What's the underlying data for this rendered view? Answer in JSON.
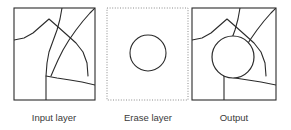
{
  "diagram": {
    "type": "erase-operation-illustration",
    "background_color": "#ffffff",
    "stroke_color": "#2b2b2b",
    "label_color": "#3a3a3a",
    "panels": [
      {
        "id": "input-layer",
        "label": "Input layer",
        "border_style": "solid",
        "label_x": 54,
        "label_y": 121,
        "frame": {
          "x": 14,
          "y": 8,
          "width": 81,
          "height": 92
        },
        "content": "polygon boundaries",
        "paths": [
          "M14,40 L24,38 L33,33 L41,26 L49,19 L57,26 L66,34 L76,43 L83,52 L87,63 L88,76",
          "M62,8 L60,19 L57,30 L53,41 L49,52 L47,63 L46,76 L46,88 L46,100",
          "M95,8 L90,13 L83,21 L76,30 L69,40 L63,50 L58,60 L54,69 L51,76",
          "M46,76 L57,78 L70,80 L82,82 L95,85"
        ]
      },
      {
        "id": "erase-layer",
        "label": "Erase layer",
        "border_style": "dotted",
        "label_x": 148,
        "label_y": 121,
        "frame": {
          "x": 107,
          "y": 8,
          "width": 81,
          "height": 92
        },
        "content": "circle",
        "circle": {
          "cx": 148,
          "cy": 53,
          "r": 18
        }
      },
      {
        "id": "output",
        "label": "Output",
        "border_style": "solid",
        "label_x": 234,
        "label_y": 121,
        "frame": {
          "x": 192,
          "y": 8,
          "width": 84,
          "height": 92
        },
        "content": "polygon boundaries erased inside circle",
        "circle": {
          "cx": 233,
          "cy": 57,
          "r": 21
        },
        "paths": [
          "M192,40 L202,38 L211,33 L219,26 L227,19 L235,26 L244,34 L254,43 L261,52 L265,63 L266,76",
          "M240,8 L238,19 L235,30 L231,41 L227,52 L225,63 L224,76 L224,88 L224,100",
          "M276,8 L271,13 L264,21 L257,30 L250,40 L244,50 L239,60 L235,69 L232,76",
          "M224,76 L235,78 L248,80 L261,82 L276,85"
        ]
      }
    ]
  }
}
